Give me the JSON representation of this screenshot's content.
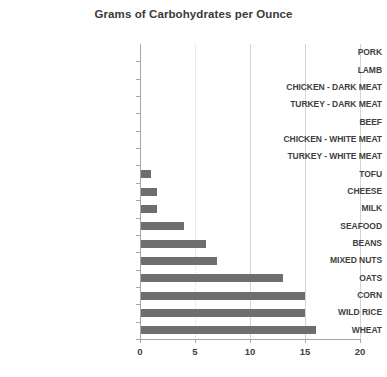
{
  "chart_data": {
    "type": "bar",
    "orientation": "horizontal",
    "title": "Grams of Carbohydrates per Ounce",
    "xlabel": "",
    "ylabel": "",
    "xlim": [
      0,
      20
    ],
    "xticks": [
      0,
      5,
      10,
      15,
      20
    ],
    "grid": "vertical",
    "legend": "none",
    "bar_color": "#6e6e6e",
    "categories": [
      "PORK",
      "LAMB",
      "CHICKEN - DARK MEAT",
      "TURKEY - DARK MEAT",
      "BEEF",
      "CHICKEN - WHITE MEAT",
      "TURKEY - WHITE MEAT",
      "TOFU",
      "CHEESE",
      "MILK",
      "SEAFOOD",
      "BEANS",
      "MIXED NUTS",
      "OATS",
      "CORN",
      "WILD RICE",
      "WHEAT"
    ],
    "values": [
      0,
      0,
      0,
      0,
      0,
      0,
      0,
      1,
      1.5,
      1.5,
      4,
      6,
      7,
      13,
      15,
      15,
      16
    ]
  }
}
